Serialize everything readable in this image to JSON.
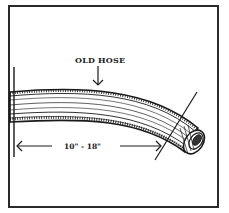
{
  "diagram": {
    "labels": {
      "hose": "OLD HOSE",
      "measurement": "10\" - 18\""
    },
    "colors": {
      "ink": "#1a1a1a",
      "background": "#ffffff"
    }
  }
}
